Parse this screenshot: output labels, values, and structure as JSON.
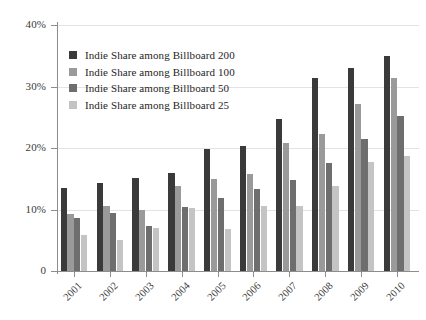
{
  "chart_data": {
    "type": "bar",
    "title": "",
    "subtitle": "",
    "xlabel": "",
    "ylabel": "",
    "ylim": [
      0,
      40
    ],
    "ytick_labels": [
      "0",
      "10%",
      "20%",
      "30%",
      "40%"
    ],
    "ytick_values": [
      0,
      10,
      20,
      30,
      40
    ],
    "grid": true,
    "grid_axis": "y",
    "legend_position": "upper-left-inside",
    "categories": [
      "2001",
      "2002",
      "2003",
      "2004",
      "2005",
      "2006",
      "2007",
      "2008",
      "2009",
      "2010"
    ],
    "series": [
      {
        "name": "Indie Share among Billboard 200",
        "color": "#3a3a3a",
        "values": [
          13.5,
          14.3,
          15.2,
          15.9,
          19.9,
          20.3,
          24.7,
          31.4,
          33.0,
          35.0
        ]
      },
      {
        "name": "Indie Share among Billboard 100",
        "color": "#9a9a9a",
        "values": [
          9.3,
          10.6,
          9.9,
          13.9,
          14.9,
          15.8,
          20.8,
          22.3,
          27.2,
          31.4
        ]
      },
      {
        "name": "Indie Share among Billboard 50",
        "color": "#6e6e6e",
        "values": [
          8.6,
          9.5,
          7.4,
          10.4,
          11.9,
          13.4,
          14.8,
          17.6,
          21.4,
          25.2
        ]
      },
      {
        "name": "Indie Share among Billboard 25",
        "color": "#c4c4c4",
        "values": [
          5.9,
          5.0,
          7.0,
          10.3,
          6.9,
          10.6,
          10.5,
          13.9,
          17.7,
          18.7
        ]
      }
    ]
  },
  "axis": {
    "y_label_suffix": "%",
    "baseline_label": "0"
  },
  "colors": {
    "axis": "#8d8d8d",
    "gridline": "#e3e3e3",
    "text": "#2b2b2b",
    "background": "#ffffff"
  }
}
